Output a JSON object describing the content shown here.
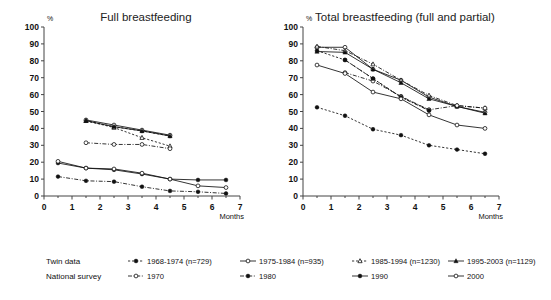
{
  "figure": {
    "width": 551,
    "height": 300,
    "background": "#ffffff"
  },
  "chart_data": [
    {
      "type": "line",
      "title": "Full breastfeeding",
      "xlabel": "Months",
      "ylabel": "%",
      "xlim": [
        0,
        7
      ],
      "ylim": [
        0,
        100
      ],
      "xticks": [
        0,
        1,
        2,
        3,
        4,
        5,
        6,
        7
      ],
      "yticks": [
        0,
        10,
        20,
        30,
        40,
        50,
        60,
        70,
        80,
        90,
        100
      ],
      "grid": false,
      "legend_position": "below-figure",
      "series": [
        {
          "name": "1968-1974 (n=729)",
          "group": "Twin data",
          "marker": "filled-circle",
          "line": "dashed",
          "x": [
            1.5,
            2.5,
            3.5,
            4.5
          ],
          "values": [
            44.5,
            41.0,
            38.5,
            35.5
          ]
        },
        {
          "name": "1975-1984 (n=935)",
          "group": "Twin data",
          "marker": "open-circle",
          "line": "solid",
          "x": [
            1.5,
            2.5,
            3.5,
            4.5
          ],
          "values": [
            45.0,
            42.0,
            39.0,
            36.0
          ]
        },
        {
          "name": "1985-1994 (n=1230)",
          "group": "Twin data",
          "marker": "open-triangle",
          "line": "dashed",
          "x": [
            1.5,
            2.5,
            3.5,
            4.5
          ],
          "values": [
            44.5,
            40.5,
            34.5,
            29.5
          ]
        },
        {
          "name": "1995-2003 (n=1129)",
          "group": "Twin data",
          "marker": "filled-triangle",
          "line": "solid",
          "x": [
            1.5,
            2.5,
            3.5,
            4.5
          ],
          "values": [
            44.5,
            41.0,
            38.5,
            35.5
          ]
        },
        {
          "name": "1970",
          "group": "National survey",
          "marker": "open-circle",
          "line": "dash-dot",
          "x": [
            1.5,
            2.5,
            3.5,
            4.5
          ],
          "values": [
            31.5,
            30.5,
            30.5,
            28.0
          ]
        },
        {
          "name": "1980",
          "group": "National survey",
          "marker": "filled-circle",
          "line": "dash-dot",
          "x": [
            0.5,
            1.5,
            2.5,
            3.5,
            4.5,
            5.5,
            6.5
          ],
          "values": [
            11.5,
            9.0,
            8.5,
            5.5,
            3.0,
            2.5,
            1.5
          ]
        },
        {
          "name": "1990",
          "group": "National survey",
          "marker": "filled-circle",
          "line": "solid",
          "x": [
            0.5,
            1.5,
            2.5,
            3.5,
            4.5,
            5.5,
            6.5
          ],
          "values": [
            19.5,
            16.5,
            15.5,
            13.0,
            10.0,
            9.5,
            9.5
          ]
        },
        {
          "name": "2000",
          "group": "National survey",
          "marker": "open-circle",
          "line": "solid",
          "x": [
            0.5,
            1.5,
            2.5,
            3.5,
            4.5,
            5.5,
            6.5
          ],
          "values": [
            20.5,
            16.5,
            16.0,
            13.5,
            10.0,
            6.0,
            5.0
          ]
        }
      ]
    },
    {
      "type": "line",
      "title": "Total breastfeeding (full and partial)",
      "xlabel": "Months",
      "ylabel": "%",
      "xlim": [
        0,
        7
      ],
      "ylim": [
        0,
        100
      ],
      "xticks": [
        0,
        1,
        2,
        3,
        4,
        5,
        6,
        7
      ],
      "yticks": [
        0,
        10,
        20,
        30,
        40,
        50,
        60,
        70,
        80,
        90,
        100
      ],
      "grid": false,
      "legend_position": "below-figure",
      "series": [
        {
          "name": "1968-1974 (n=729)",
          "group": "Twin data",
          "marker": "filled-circle",
          "line": "dashed",
          "x": [
            0.5,
            1.5,
            2.5,
            3.5,
            4.5
          ],
          "values": [
            86.0,
            80.5,
            69.5,
            58.5,
            51.0
          ]
        },
        {
          "name": "1975-1984 (n=935)",
          "group": "Twin data",
          "marker": "open-circle",
          "line": "solid",
          "x": [
            0.5,
            1.5,
            2.5,
            3.5,
            4.5,
            5.5,
            6.5
          ],
          "values": [
            88.0,
            88.0,
            75.0,
            68.5,
            58.5,
            53.0,
            49.5
          ]
        },
        {
          "name": "1985-1994 (n=1230)",
          "group": "Twin data",
          "marker": "open-triangle",
          "line": "dash-dot",
          "x": [
            0.5,
            1.5,
            2.5,
            3.5,
            4.5,
            5.5,
            6.5
          ],
          "values": [
            88.5,
            86.0,
            78.0,
            68.5,
            59.5,
            53.5,
            52.0
          ]
        },
        {
          "name": "1995-2003 (n=1129)",
          "group": "Twin data",
          "marker": "filled-triangle",
          "line": "solid",
          "x": [
            0.5,
            1.5,
            2.5,
            3.5,
            4.5,
            5.5,
            6.5
          ],
          "values": [
            85.5,
            85.0,
            75.0,
            67.0,
            57.5,
            53.0,
            49.0
          ]
        },
        {
          "name": "1970",
          "group": "National survey",
          "marker": "open-circle",
          "line": "dash-dot",
          "x": [
            1.5,
            2.5,
            3.5,
            4.5,
            5.5,
            6.5
          ],
          "values": [
            73.0,
            68.0,
            59.0,
            51.0,
            53.5,
            52.0
          ]
        },
        {
          "name": "1980",
          "group": "National survey",
          "marker": "filled-circle",
          "line": "dashed",
          "x": [
            0.5,
            1.5,
            2.5,
            3.5,
            4.5,
            5.5,
            6.5
          ],
          "values": [
            52.5,
            47.5,
            39.5,
            36.0,
            30.0,
            27.5,
            25.0
          ]
        },
        {
          "name": "1990",
          "group": "National survey",
          "marker": "filled-circle",
          "line": "dash-dot",
          "x": [
            1.5,
            2.5,
            3.5,
            4.5
          ],
          "values": [
            80.5,
            69.5,
            58.5,
            50.5
          ]
        },
        {
          "name": "2000",
          "group": "National survey",
          "marker": "open-circle",
          "line": "solid",
          "x": [
            0.5,
            1.5,
            2.5,
            3.5,
            4.5,
            5.5,
            6.5
          ],
          "values": [
            77.5,
            72.5,
            61.5,
            57.5,
            48.0,
            42.0,
            40.0
          ]
        }
      ]
    }
  ],
  "legend": {
    "rows": [
      {
        "heading": "Twin data",
        "entries": [
          {
            "label": "1968-1974 (n=729)",
            "marker": "filled-circle",
            "line": "dashed"
          },
          {
            "label": "1975-1984 (n=935)",
            "marker": "open-circle",
            "line": "solid"
          },
          {
            "label": "1985-1994 (n=1230)",
            "marker": "open-triangle",
            "line": "dashed"
          },
          {
            "label": "1995-2003 (n=1129)",
            "marker": "filled-triangle",
            "line": "solid"
          }
        ]
      },
      {
        "heading": "National survey",
        "entries": [
          {
            "label": "1970",
            "marker": "open-circle",
            "line": "dash-dot"
          },
          {
            "label": "1980",
            "marker": "filled-circle",
            "line": "dash-dot"
          },
          {
            "label": "1990",
            "marker": "filled-circle",
            "line": "solid"
          },
          {
            "label": "2000",
            "marker": "open-circle",
            "line": "solid"
          }
        ]
      }
    ]
  },
  "colors": {
    "ink": "#111111",
    "axis": "#444444",
    "background": "#ffffff"
  }
}
